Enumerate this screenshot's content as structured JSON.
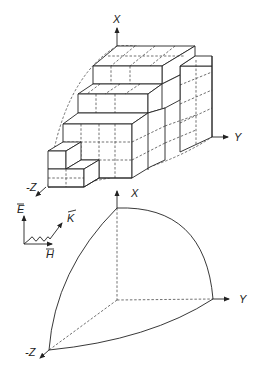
{
  "figure_top": {
    "title": "Staircase (voxel) approximation of a spherical octant",
    "axis_labels": {
      "x": "X",
      "y": "Y",
      "z": "-Z"
    }
  },
  "figure_bottom": {
    "title": "Spherical octant (smooth surface)",
    "axis_labels": {
      "x": "X",
      "y": "Y",
      "z": "-Z"
    }
  },
  "inset": {
    "e_label": "E",
    "h_label": "H",
    "k_label": "K",
    "e_superscript": "i",
    "h_superscript": "i"
  },
  "colors": {
    "line": "#222222",
    "background": "#ffffff"
  }
}
